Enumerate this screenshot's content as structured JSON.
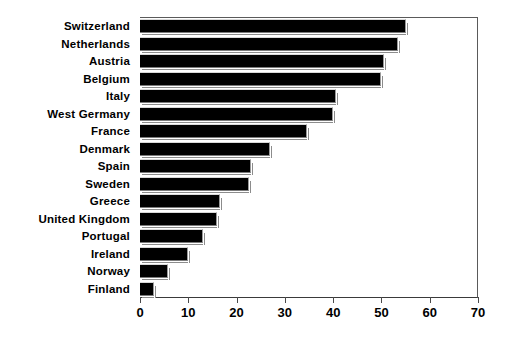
{
  "chart_data": {
    "type": "bar",
    "orientation": "horizontal",
    "title": "",
    "subtitle": "",
    "xlabel": "",
    "ylabel": "",
    "xlim": [
      0,
      70
    ],
    "ylim": null,
    "grid": false,
    "legend": null,
    "xticks": [
      0,
      10,
      20,
      30,
      40,
      50,
      60,
      70
    ],
    "xtick_labels": [
      "0",
      "10",
      "20",
      "30",
      "40",
      "50",
      "60",
      "70"
    ],
    "categories": [
      "Switzerland",
      "Netherlands",
      "Austria",
      "Belgium",
      "Italy",
      "West Germany",
      "France",
      "Denmark",
      "Spain",
      "Sweden",
      "Greece",
      "United Kingdom",
      "Portugal",
      "Ireland",
      "Norway",
      "Finland"
    ],
    "values": [
      55,
      53.5,
      50.5,
      50,
      40.5,
      40,
      34.5,
      27,
      23,
      22.5,
      16.5,
      16,
      13,
      10,
      5.8,
      3
    ],
    "bar_color": "#000000",
    "background_color": "#ffffff"
  }
}
